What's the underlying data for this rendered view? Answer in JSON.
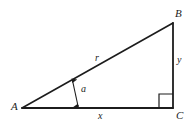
{
  "figure": {
    "type": "right-triangle-geometry-diagram",
    "background_color": "#ffffff",
    "stroke_color": "#1c1c1c",
    "vertices": {
      "A": {
        "label": "A",
        "x": 22,
        "y": 108
      },
      "B": {
        "label": "B",
        "x": 173,
        "y": 23
      },
      "C": {
        "label": "C",
        "x": 173,
        "y": 108
      }
    },
    "sides": {
      "hypotenuse": {
        "label": "r",
        "from": "A",
        "to": "B"
      },
      "base": {
        "label": "x",
        "from": "A",
        "to": "C"
      },
      "vertical": {
        "label": "y",
        "from": "B",
        "to": "C"
      }
    },
    "angle": {
      "label": "a",
      "at_vertex": "A",
      "marker": "double-headed-arrow"
    },
    "right_angle": {
      "at_vertex": "C",
      "marker": "square",
      "size": 14
    }
  }
}
